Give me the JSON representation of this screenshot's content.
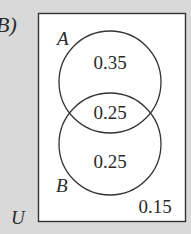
{
  "diagram": {
    "type": "venn",
    "prefix_label": "B)",
    "universe_label": "U",
    "sets": [
      {
        "name": "A",
        "only_value": "0.35"
      },
      {
        "name": "B",
        "only_value": "0.25"
      }
    ],
    "intersection_value": "0.25",
    "outside_value": "0.15",
    "colors": {
      "background": "#d9d9d9",
      "box_fill": "#ffffff",
      "stroke": "#333333",
      "text": "#2a2a2a"
    }
  }
}
